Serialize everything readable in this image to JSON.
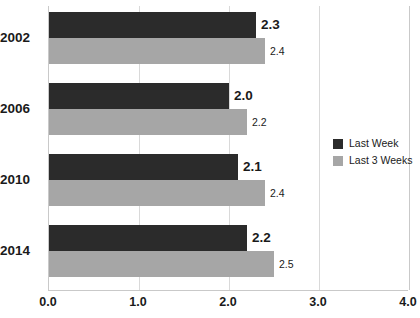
{
  "chart_data": {
    "type": "bar",
    "orientation": "horizontal",
    "title": "",
    "xlabel": "",
    "ylabel": "",
    "categories": [
      "2002",
      "2006",
      "2010",
      "2014"
    ],
    "series": [
      {
        "name": "Last Week",
        "color": "#2b2b2b",
        "values": [
          2.3,
          2.0,
          2.1,
          2.2
        ]
      },
      {
        "name": "Last 3 Weeks",
        "color": "#a6a6a6",
        "values": [
          2.4,
          2.2,
          2.4,
          2.5
        ]
      }
    ],
    "value_labels": [
      [
        "2.3",
        "2.4"
      ],
      [
        "2.0",
        "2.2"
      ],
      [
        "2.1",
        "2.4"
      ],
      [
        "2.2",
        "2.5"
      ]
    ],
    "xlim": [
      0.0,
      4.0
    ],
    "xticks": [
      0.0,
      1.0,
      2.0,
      3.0,
      4.0
    ],
    "xtick_labels": [
      "0.0",
      "1.0",
      "2.0",
      "3.0",
      "4.0"
    ],
    "grid": true,
    "grid_axis": "x",
    "grid_color": "#d9d9d9",
    "axis_color": "#c9c9c9",
    "legend_position": "right",
    "background": "#ffffff"
  }
}
